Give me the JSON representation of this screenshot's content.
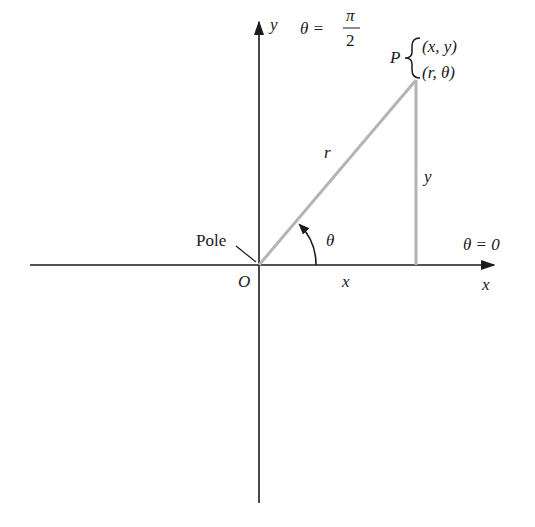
{
  "diagram": {
    "axes": {
      "x_label": "x",
      "y_label": "y",
      "origin_label": "O",
      "pole_label": "Pole",
      "positive_x_angle_label": "θ = 0",
      "positive_y_angle": {
        "theta": "θ =",
        "numerator": "π",
        "denominator": "2"
      }
    },
    "point": {
      "name": "P",
      "rect_coords": "(x, y)",
      "polar_coords": "(r, θ)"
    },
    "segments": {
      "radius_label": "r",
      "horizontal_label": "x",
      "vertical_label": "y",
      "angle_label": "θ"
    },
    "colors": {
      "axis": "#1a1a1a",
      "triangle": "#b4b4b4",
      "text": "#1a1a1a"
    },
    "geometry": {
      "origin": [
        259,
        265
      ],
      "point_P": [
        416,
        80
      ],
      "x_axis_range": [
        30,
        494
      ],
      "y_axis_range": [
        22,
        503
      ]
    }
  }
}
